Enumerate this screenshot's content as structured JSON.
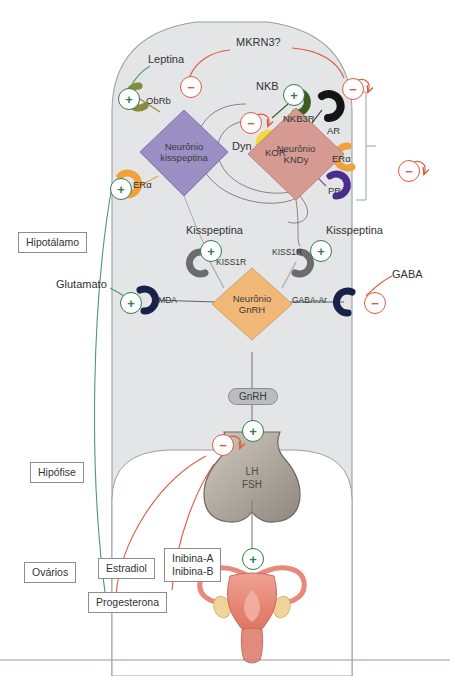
{
  "diagram": {
    "regions": [
      {
        "id": "hipotalamo",
        "label": "Hipotálamo"
      },
      {
        "id": "hipofise",
        "label": "Hipófise"
      },
      {
        "id": "ovarios",
        "label": "Ovários"
      }
    ],
    "neurons": [
      {
        "id": "kisspeptina",
        "line1": "Neurônio",
        "line2": "kisspeptina",
        "color": "#9b8fc4"
      },
      {
        "id": "kndy",
        "line1": "Neurônio",
        "line2": "KNDy",
        "color": "#d79a92"
      },
      {
        "id": "gnrh",
        "line1": "Neurônio",
        "line2": "GnRH",
        "color": "#f2b877"
      }
    ],
    "ligands": [
      {
        "id": "leptina",
        "label": "Leptina"
      },
      {
        "id": "mkrn3",
        "label": "MKRN3?"
      },
      {
        "id": "nkb",
        "label": "NKB"
      },
      {
        "id": "dyn",
        "label": "Dyn"
      },
      {
        "id": "glutamato",
        "label": "Glutamato"
      },
      {
        "id": "gaba",
        "label": "GABA"
      },
      {
        "id": "kisspeptina-left",
        "label": "Kisspeptina"
      },
      {
        "id": "kisspeptina-right",
        "label": "Kisspeptina"
      }
    ],
    "receptors": [
      {
        "id": "obrb",
        "label": "ObRb",
        "color": "#8a8b3a"
      },
      {
        "id": "eralpha-kiss",
        "label": "ERα",
        "color": "#f0a13c"
      },
      {
        "id": "nkb3r",
        "label": "NKB3R",
        "color": "#3f5c1e"
      },
      {
        "id": "kor",
        "label": "KOR",
        "color": "#f5d93c"
      },
      {
        "id": "ar",
        "label": "AR",
        "color": "#141414"
      },
      {
        "id": "eralpha-kndy",
        "label": "ERα",
        "color": "#f0a13c"
      },
      {
        "id": "pr",
        "label": "PR",
        "color": "#4b2d8f"
      },
      {
        "id": "kiss1r-left",
        "label": "KISS1R",
        "color": "#6b6b6b"
      },
      {
        "id": "kiss1r-right",
        "label": "KISS1R",
        "color": "#6b6b6b"
      },
      {
        "id": "nmda",
        "label": "NMDA",
        "color": "#17224a"
      },
      {
        "id": "gaba-ar",
        "label": "GABA-Ar",
        "color": "#17224a"
      }
    ],
    "pituitary": {
      "hormone1": "LH",
      "hormone2": "FSH"
    },
    "gnrh_pill": "GnRH",
    "ovary_outputs": [
      {
        "id": "estradiol",
        "label": "Estradiol"
      },
      {
        "id": "progesterona",
        "label": "Progesterona"
      },
      {
        "id": "inibina",
        "label": "Inibina-A\nInibina-B",
        "line1": "Inibina-A",
        "line2": "Inibina-B"
      }
    ],
    "signs": {
      "plus": "+",
      "minus": "−"
    },
    "colors": {
      "brain_fill": "#e3e5e7",
      "brain_stroke": "#9aa0a4",
      "excite": "#2e7d4f",
      "inhibit": "#e05a3f",
      "estradiol_line": "#4a9b6e",
      "progesterona_line": "#e05a3f",
      "neural_line": "#8a6f74",
      "uterus": "#e9897c"
    }
  }
}
